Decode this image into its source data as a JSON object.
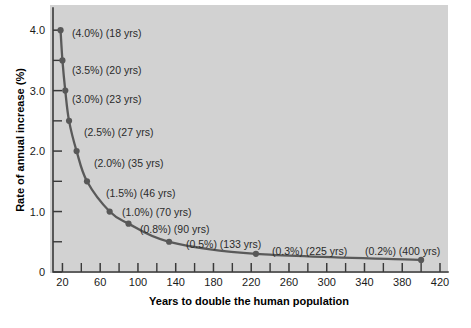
{
  "chart_data": {
    "type": "line",
    "title": "",
    "xlabel": "Years to double the human population",
    "ylabel": "Rate of annual increase (%)",
    "xlim": [
      10,
      420
    ],
    "ylim": [
      0,
      4.35
    ],
    "grid": false,
    "legend": "none",
    "line_color": "#5a5a5a",
    "marker_color": "#585858",
    "plot_background": "#d2d2d2",
    "page_background": "#ffffff",
    "x": [
      18,
      20,
      23,
      27,
      35,
      46,
      70,
      90,
      133,
      225,
      400
    ],
    "y": [
      4.0,
      3.5,
      3.0,
      2.5,
      2.0,
      1.5,
      1.0,
      0.8,
      0.5,
      0.3,
      0.2
    ],
    "x_ticks_labeled": [
      20,
      60,
      100,
      140,
      180,
      220,
      260,
      300,
      340,
      380,
      420
    ],
    "x_tick_labels": [
      "20",
      "60",
      "100",
      "140",
      "180",
      "220",
      "260",
      "300",
      "340",
      "380",
      "420"
    ],
    "x_ticks_minor": [
      40,
      80,
      120,
      160,
      200,
      240,
      280,
      320,
      360,
      400
    ],
    "y_ticks_labeled": [
      0,
      1.0,
      2.0,
      3.0,
      4.0
    ],
    "y_tick_labels": [
      "0",
      "1.0",
      "2.0",
      "3.0",
      "4.0"
    ],
    "y_ticks_minor": [
      0.5,
      1.5,
      2.5,
      3.5
    ],
    "point_labels": [
      "(4.0%) (18 yrs)",
      "(3.5%) (20 yrs)",
      "(3.0%) (23 yrs)",
      "(2.5%) (27 yrs)",
      "(2.0%) (35 yrs)",
      "(1.5%) (46 yrs)",
      "(1.0%) (70 yrs)",
      "(0.8%) (90 yrs)",
      "(0.5%) (133 yrs)",
      "(0.3%) (225 yrs)",
      "(0.2%) (400 yrs)"
    ],
    "point_label_positions": [
      {
        "x": 72,
        "y": 37
      },
      {
        "x": 72,
        "y": 74
      },
      {
        "x": 72,
        "y": 103
      },
      {
        "x": 84,
        "y": 136
      },
      {
        "x": 94,
        "y": 167
      },
      {
        "x": 106,
        "y": 197
      },
      {
        "x": 122,
        "y": 216
      },
      {
        "x": 140,
        "y": 233
      },
      {
        "x": 186,
        "y": 248
      },
      {
        "x": 272,
        "y": 255
      },
      {
        "x": 365,
        "y": 255
      }
    ]
  }
}
